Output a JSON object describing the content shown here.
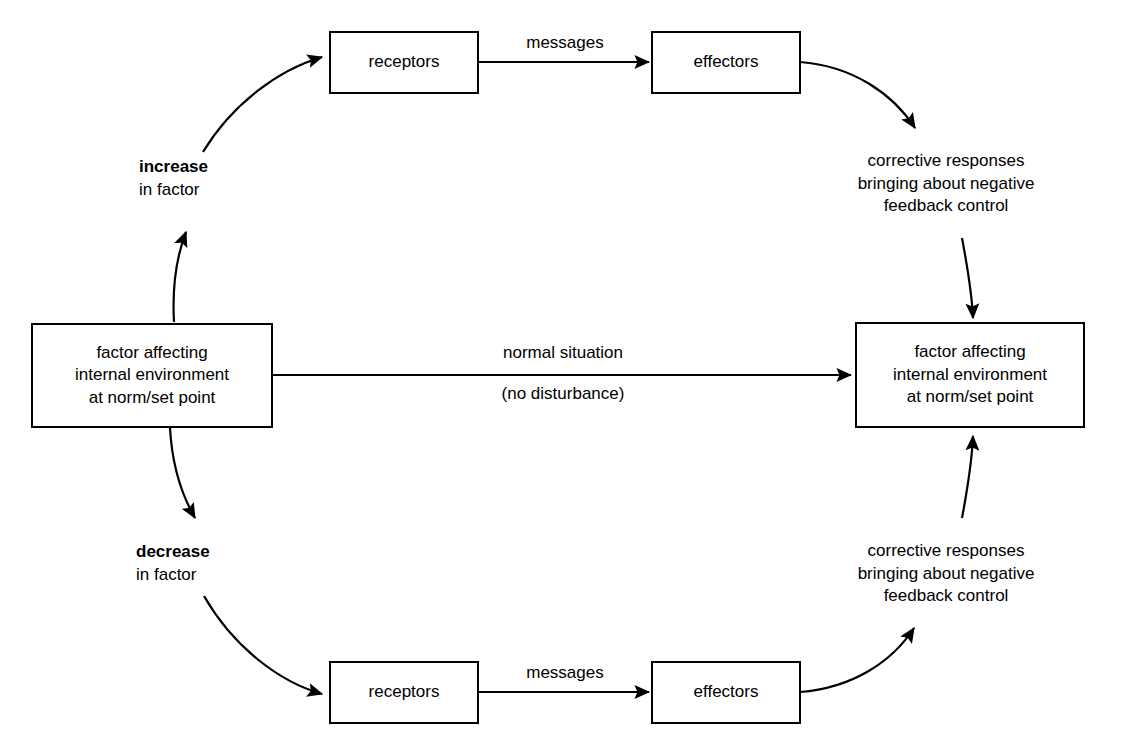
{
  "diagram": {
    "nodes": {
      "factor_left": {
        "lines": [
          "factor affecting",
          "internal environment",
          "at norm/set point"
        ]
      },
      "factor_right": {
        "lines": [
          "factor affecting",
          "internal environment",
          "at norm/set point"
        ]
      },
      "receptors_top": {
        "label": "receptors"
      },
      "effectors_top": {
        "label": "effectors"
      },
      "receptors_bottom": {
        "label": "receptors"
      },
      "effectors_bottom": {
        "label": "effectors"
      }
    },
    "labels": {
      "increase": {
        "strong": "increase",
        "rest": "in factor"
      },
      "decrease": {
        "strong": "decrease",
        "rest": "in factor"
      },
      "messages_top": "messages",
      "messages_bottom": "messages",
      "normal_situation": "normal situation",
      "no_disturbance": "(no disturbance)",
      "corrective_top": [
        "corrective responses",
        "bringing about negative",
        "feedback control"
      ],
      "corrective_bottom": [
        "corrective responses",
        "bringing about negative",
        "feedback control"
      ]
    },
    "colors": {
      "stroke": "#000000",
      "text": "#000000",
      "background": "#ffffff"
    }
  }
}
